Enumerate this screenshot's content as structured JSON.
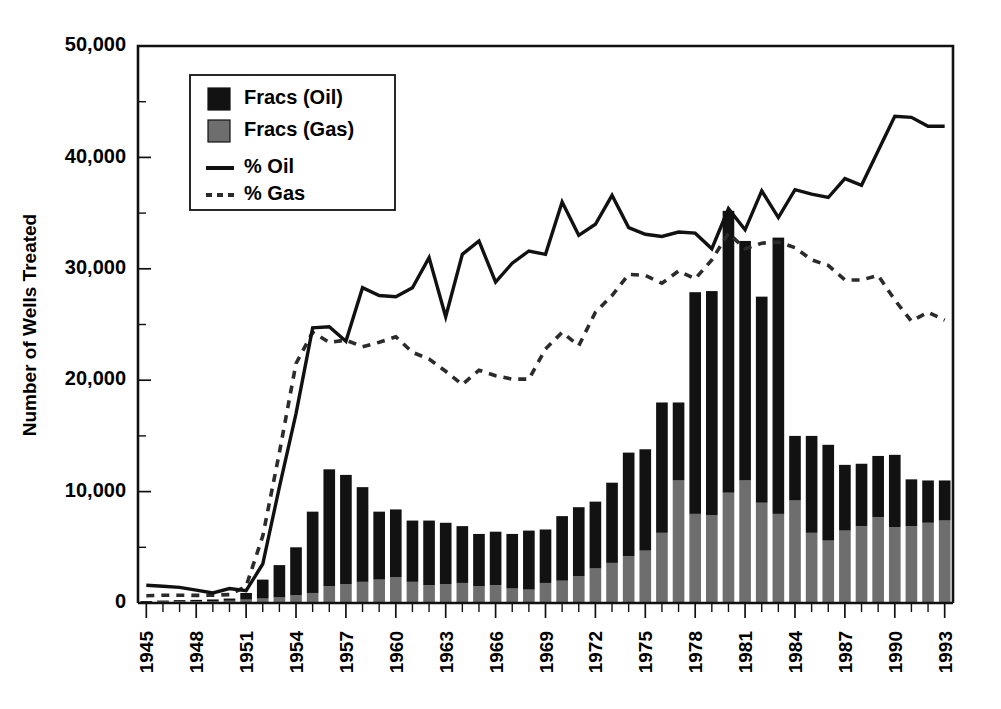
{
  "chart_data": {
    "type": "bar",
    "title": "",
    "subtitle": "",
    "xlabel": "",
    "ylabel": "Number of Wells Treated",
    "ylim": [
      0,
      50000
    ],
    "xlim": [
      1945,
      1993
    ],
    "grid": false,
    "legend_position": "top-left",
    "y_ticks": [
      0,
      10000,
      20000,
      30000,
      40000,
      50000
    ],
    "y_tick_labels": [
      "0",
      "10,000",
      "20,000",
      "30,000",
      "40,000",
      "50,000"
    ],
    "y_minor_tick_interval": 5000,
    "x_tick_labels": [
      "1945",
      "1948",
      "1951",
      "1954",
      "1957",
      "1960",
      "1963",
      "1966",
      "1969",
      "1972",
      "1975",
      "1978",
      "1981",
      "1984",
      "1987",
      "1990",
      "1993"
    ],
    "x_tick_label_interval": 3,
    "x": [
      1945,
      1946,
      1947,
      1948,
      1949,
      1950,
      1951,
      1952,
      1953,
      1954,
      1955,
      1956,
      1957,
      1958,
      1959,
      1960,
      1961,
      1962,
      1963,
      1964,
      1965,
      1966,
      1967,
      1968,
      1969,
      1970,
      1971,
      1972,
      1973,
      1974,
      1975,
      1976,
      1977,
      1978,
      1979,
      1980,
      1981,
      1982,
      1983,
      1984,
      1985,
      1986,
      1987,
      1988,
      1989,
      1990,
      1991,
      1992,
      1993
    ],
    "series": [
      {
        "name": "Fracs (Gas)",
        "type": "bar",
        "stack": "wells",
        "color": "#6e6e6e",
        "values": [
          100,
          120,
          140,
          150,
          170,
          200,
          300,
          400,
          500,
          700,
          900,
          1500,
          1700,
          1900,
          2100,
          2300,
          1900,
          1600,
          1700,
          1800,
          1500,
          1600,
          1300,
          1200,
          1800,
          2000,
          2400,
          3100,
          3600,
          4200,
          4700,
          6300,
          11000,
          8000,
          7900,
          9900,
          11000,
          9000,
          8000,
          9200,
          6300,
          5600,
          6500,
          6900,
          7700,
          6800,
          6900,
          7200,
          7400
        ]
      },
      {
        "name": "Fracs (Oil)",
        "type": "bar",
        "stack": "wells",
        "color": "#121212",
        "values": [
          80,
          100,
          120,
          130,
          150,
          200,
          600,
          1700,
          2900,
          4300,
          7300,
          10500,
          9800,
          8500,
          6100,
          6100,
          5500,
          5800,
          5500,
          5100,
          4700,
          4800,
          4900,
          5300,
          4800,
          5800,
          6200,
          6000,
          7200,
          9300,
          9100,
          11700,
          7000,
          19900,
          20100,
          25300,
          21500,
          18500,
          24800,
          5800,
          8700,
          8600,
          5900,
          5600,
          5500,
          6500,
          4200,
          3800,
          3600
        ]
      },
      {
        "name": "% Oil",
        "type": "line",
        "style": "solid",
        "color": "#111111",
        "values": [
          1600,
          1500,
          1400,
          1150,
          900,
          1300,
          1100,
          3500,
          10400,
          17000,
          24700,
          24800,
          23500,
          28300,
          27600,
          27500,
          28300,
          31000,
          25700,
          31300,
          32500,
          28800,
          30500,
          31600,
          31300,
          36000,
          33000,
          34000,
          36600,
          33700,
          33100,
          32900,
          33300,
          33200,
          31800,
          35400,
          33500,
          37000,
          34600,
          37100,
          36700,
          36400,
          38100,
          37500,
          40600,
          43700,
          43600,
          42800,
          42800
        ]
      },
      {
        "name": "% Gas",
        "type": "line",
        "style": "dotted",
        "color": "#2b2b2b",
        "values": [
          650,
          700,
          700,
          680,
          700,
          750,
          1500,
          6000,
          13500,
          21500,
          24300,
          23400,
          23600,
          23000,
          23400,
          23900,
          22500,
          21900,
          20800,
          19600,
          20900,
          20400,
          20100,
          20100,
          22800,
          24300,
          23100,
          26100,
          27600,
          29500,
          29400,
          28700,
          29800,
          29100,
          30800,
          33200,
          31800,
          32300,
          32400,
          31900,
          30800,
          30300,
          29000,
          29000,
          29400,
          27200,
          25300,
          26100,
          25400
        ]
      }
    ]
  },
  "legend": {
    "items": [
      {
        "label": "Fracs (Oil)",
        "marker": "square-black"
      },
      {
        "label": "Fracs (Gas)",
        "marker": "square-gray"
      },
      {
        "label": "% Oil",
        "marker": "line-solid"
      },
      {
        "label": "% Gas",
        "marker": "line-dotted"
      }
    ]
  },
  "colors": {
    "oil_bar": "#121212",
    "gas_bar": "#6e6e6e",
    "oil_line": "#111111",
    "gas_line": "#2b2b2b",
    "axis": "#111111",
    "background": "#ffffff"
  }
}
